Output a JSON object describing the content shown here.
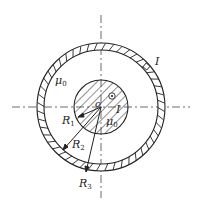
{
  "diagram": {
    "type": "coaxial-cable-cross-section",
    "labels": {
      "mu_outer": "μ",
      "mu_outer_sub": "0",
      "mu_inner": "μ",
      "mu_inner_sub": "0",
      "center": "o",
      "current_inner": "I",
      "current_outer": "I",
      "r1": "R",
      "r1_sub": "1",
      "r2": "R",
      "r2_sub": "2",
      "r3": "R",
      "r3_sub": "3"
    },
    "colors": {
      "stroke": "#222222",
      "background": "#ffffff"
    }
  }
}
